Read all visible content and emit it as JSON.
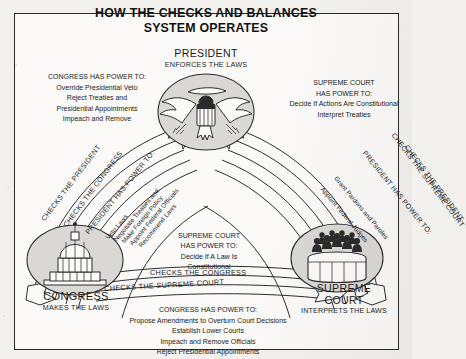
{
  "title": "HOW THE CHECKS AND BALANCES\nSYSTEM OPERATES",
  "title_line1": "HOW THE CHECKS AND BALANCES",
  "title_line2": "SYSTEM OPERATES",
  "colors": {
    "paper": "#fbfaf8",
    "page": "#f2f1ee",
    "ink": "#2b2b2b",
    "seal_fill": "#d9d8d5"
  },
  "nodes": {
    "president": {
      "name": "PRESIDENT",
      "role": "ENFORCES THE LAWS",
      "icon": "eagle-seal-icon"
    },
    "congress": {
      "name": "CONGRESS",
      "role": "MAKES THE LAWS",
      "icon": "capitol-dome-icon"
    },
    "supreme_court": {
      "name_line1": "SUPREME",
      "name_line2": "COURT",
      "name": "SUPREME COURT",
      "role": "INTERPRETS THE LAWS",
      "icon": "justices-bench-icon"
    }
  },
  "power_blocks": {
    "congress_over_president": {
      "heading": "CONGRESS HAS POWER TO:",
      "items": [
        "Override Presidential Veto",
        "Reject Treaties and",
        "Presidential Appointments",
        "Impeach and Remove"
      ]
    },
    "supreme_over_president": {
      "heading_line1": "SUPREME COURT",
      "heading_line2": "HAS POWER TO:",
      "items": [
        "Decide If Actions Are Constitutional",
        "Interpret Treaties"
      ]
    },
    "president_over_congress": {
      "heading": "PRESIDENT HAS POWER TO:",
      "items": [
        "Veto Laws",
        "Negotiate Treaties and",
        "Make Foreign Policy",
        "Appoint Federal Officials",
        "Recommend Laws"
      ]
    },
    "president_over_court": {
      "heading": "PRESIDENT HAS POWER TO:",
      "items": [
        "Grant Pardons and Paroles",
        "Appoint Federal Judges"
      ]
    },
    "supreme_over_congress": {
      "heading_line1": "SUPREME COURT",
      "heading_line2": "HAS POWER TO:",
      "items": [
        "Decide If A Law Is",
        "Constitutional"
      ]
    },
    "congress_over_court": {
      "heading": "CONGRESS HAS POWER TO:",
      "items": [
        "Propose Amendments to Overturn Court Decisions",
        "Establish Lower Courts",
        "Impeach and Remove Officials",
        "Reject Presidential Appointments"
      ]
    }
  },
  "arrow_labels": {
    "left_outer": "CHECKS THE PRESIDENT",
    "left_inner": "CHECKS THE CONGRESS",
    "right_outer": "CHECKS THE PRESIDENT",
    "right_inner": "CHECKS THE SUPREME COURT",
    "band_upper": "CHECKS THE CONGRESS",
    "band_lower": "CHECKS THE SUPREME COURT"
  }
}
